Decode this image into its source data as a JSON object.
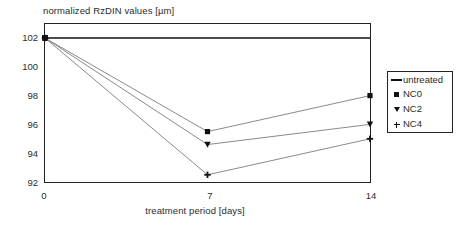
{
  "chart_data": {
    "type": "line",
    "title": "normalized RzDIN values [µm]",
    "xlabel": "treatment period [days]",
    "ylabel": "",
    "x": [
      0,
      7,
      14
    ],
    "xticklabels": [
      "0",
      "7",
      "14"
    ],
    "yticks": [
      92,
      94,
      96,
      98,
      100,
      102
    ],
    "yticklabels": [
      "92",
      "94",
      "96",
      "98",
      "100",
      "102"
    ],
    "xlim": [
      0,
      14
    ],
    "ylim": [
      91.0,
      103.1
    ],
    "grid": false,
    "legend_position": "right-outside",
    "series": [
      {
        "name": "untreated",
        "marker": "line",
        "values": [
          102.0,
          102.0,
          102.0
        ],
        "color": "#111111"
      },
      {
        "name": "NC0",
        "marker": "square",
        "values": [
          102.0,
          95.5,
          98.0
        ],
        "color": "#111111"
      },
      {
        "name": "NC2",
        "marker": "triangle-down",
        "values": [
          102.0,
          94.6,
          96.0
        ],
        "color": "#111111"
      },
      {
        "name": "NC4",
        "marker": "plus",
        "values": [
          102.0,
          92.5,
          95.0
        ],
        "color": "#111111"
      }
    ]
  },
  "legend": {
    "items": [
      {
        "label": "untreated",
        "symbol": "line-symbol"
      },
      {
        "label": "NC0",
        "symbol": "square-symbol"
      },
      {
        "label": "NC2",
        "symbol": "triangle-down-symbol"
      },
      {
        "label": "NC4",
        "symbol": "plus-symbol"
      }
    ]
  },
  "axes": {
    "y_tick_labels": [
      "102",
      "100",
      "98",
      "96",
      "94",
      "92"
    ],
    "x_tick_labels": [
      "0",
      "7",
      "14"
    ]
  },
  "colors": {
    "axis": "#222222",
    "series": "#111111",
    "line": "#8a8a8a",
    "background": "#ffffff"
  }
}
